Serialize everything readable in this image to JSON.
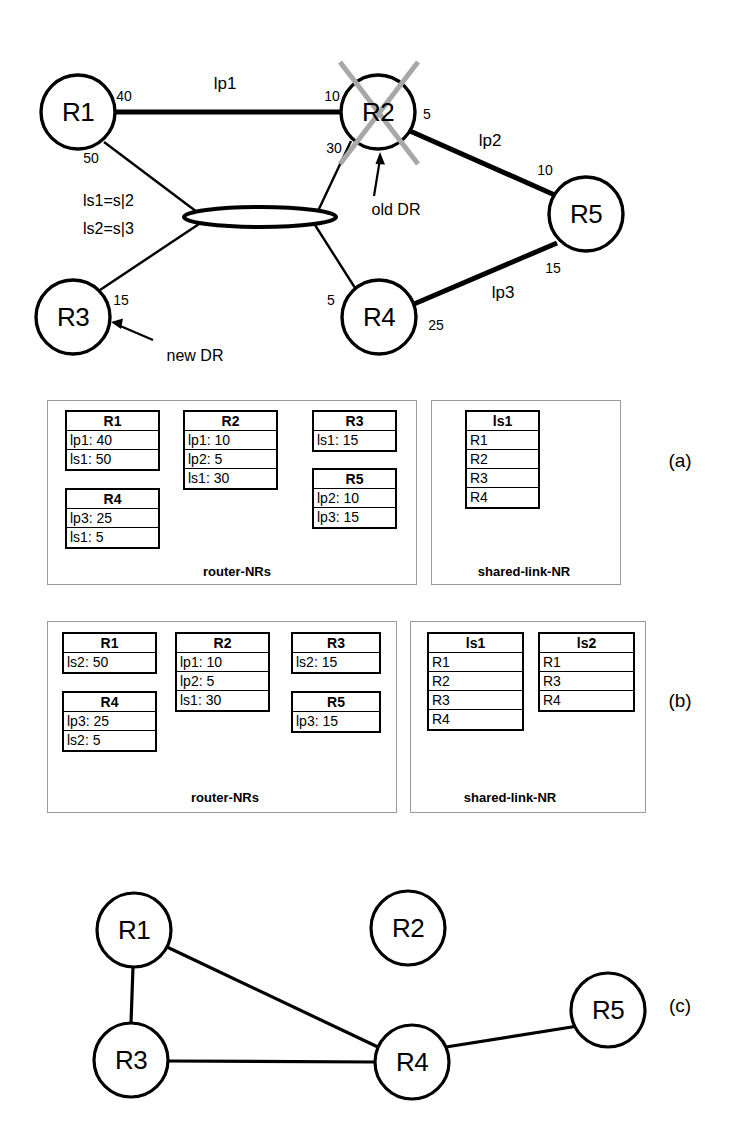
{
  "figure": {
    "panel_letters": [
      "(a)",
      "(b)",
      "(c)"
    ]
  },
  "topology": {
    "caption_old_dr": "old DR",
    "caption_new_dr": "new DR",
    "shared_link_eq1": "ls1=s|2",
    "shared_link_eq2": "ls2=s|3",
    "failed_router": "R2",
    "nodes": [
      {
        "id": "R1",
        "label": "R1",
        "cx": 78,
        "cy": 112
      },
      {
        "id": "R2",
        "label": "R2",
        "cx": 378,
        "cy": 112
      },
      {
        "id": "R3",
        "label": "R3",
        "cx": 73,
        "cy": 317
      },
      {
        "id": "R4",
        "label": "R4",
        "cx": 379,
        "cy": 317
      },
      {
        "id": "R5",
        "label": "R5",
        "cx": 586,
        "cy": 214
      }
    ],
    "shared_link": {
      "cx": 260,
      "cy": 217,
      "rx": 76,
      "ry": 10
    },
    "links": [
      {
        "name": "lp1",
        "from": "R1",
        "to": "R2",
        "w_from": "40",
        "w_to": "10"
      },
      {
        "name": "lp2",
        "from": "R2",
        "to": "R5",
        "w_from": "5",
        "w_to": "10"
      },
      {
        "name": "lp3",
        "from": "R4",
        "to": "R5",
        "w_from": "25",
        "w_to": "15"
      },
      {
        "name": "",
        "from": "R1",
        "to": "shared",
        "w_from": "50",
        "w_to": ""
      },
      {
        "name": "",
        "from": "R2",
        "to": "shared",
        "w_from": "30",
        "w_to": ""
      },
      {
        "name": "",
        "from": "R3",
        "to": "shared",
        "w_from": "15",
        "w_to": ""
      },
      {
        "name": "",
        "from": "R4",
        "to": "shared",
        "w_from": "5",
        "w_to": ""
      }
    ],
    "weight_labels": [
      {
        "text": "40",
        "x": 124,
        "y": 96
      },
      {
        "text": "10",
        "x": 332,
        "y": 96
      },
      {
        "text": "5",
        "x": 427,
        "y": 114
      },
      {
        "text": "50",
        "x": 91,
        "y": 158
      },
      {
        "text": "30",
        "x": 334,
        "y": 148
      },
      {
        "text": "10",
        "x": 545,
        "y": 170
      },
      {
        "text": "15",
        "x": 553,
        "y": 268
      },
      {
        "text": "15",
        "x": 121,
        "y": 300
      },
      {
        "text": "5",
        "x": 331,
        "y": 300
      },
      {
        "text": "25",
        "x": 436,
        "y": 325
      }
    ],
    "link_name_labels": [
      {
        "text": "lp1",
        "x": 225,
        "y": 83
      },
      {
        "text": "lp2",
        "x": 490,
        "y": 140
      },
      {
        "text": "lp3",
        "x": 503,
        "y": 292
      }
    ]
  },
  "panel_a": {
    "letter": "(a)",
    "router_caption": "router-NRs",
    "shared_caption": "shared-link-NR",
    "router_nrs": [
      {
        "header": "R1",
        "rows": [
          "lp1: 40",
          "ls1: 50"
        ]
      },
      {
        "header": "R2",
        "rows": [
          "lp1: 10",
          "lp2: 5",
          "ls1: 30"
        ]
      },
      {
        "header": "R3",
        "rows": [
          "ls1: 15"
        ]
      },
      {
        "header": "R4",
        "rows": [
          "lp3: 25",
          "ls1: 5"
        ]
      },
      {
        "header": "R5",
        "rows": [
          "lp2: 10",
          "lp3: 15"
        ]
      }
    ],
    "shared_link_nrs": [
      {
        "header": "ls1",
        "rows": [
          "R1",
          "R2",
          "R3",
          "R4"
        ]
      }
    ]
  },
  "panel_b": {
    "letter": "(b)",
    "router_caption": "router-NRs",
    "shared_caption": "shared-link-NR",
    "router_nrs": [
      {
        "header": "R1",
        "rows": [
          "ls2: 50"
        ]
      },
      {
        "header": "R2",
        "rows": [
          "lp1: 10",
          "lp2: 5",
          "ls1: 30"
        ]
      },
      {
        "header": "R3",
        "rows": [
          "ls2: 15"
        ]
      },
      {
        "header": "R4",
        "rows": [
          "lp3: 25",
          "ls2: 5"
        ]
      },
      {
        "header": "R5",
        "rows": [
          "lp3: 15"
        ]
      }
    ],
    "shared_link_nrs": [
      {
        "header": "ls1",
        "rows": [
          "R1",
          "R2",
          "R3",
          "R4"
        ]
      },
      {
        "header": "ls2",
        "rows": [
          "R1",
          "R3",
          "R4"
        ]
      }
    ]
  },
  "panel_c": {
    "letter": "(c)",
    "nodes": [
      {
        "id": "R1",
        "label": "R1",
        "cx": 134,
        "cy": 930
      },
      {
        "id": "R2",
        "label": "R2",
        "cx": 408,
        "cy": 928
      },
      {
        "id": "R3",
        "label": "R3",
        "cx": 131,
        "cy": 1060
      },
      {
        "id": "R4",
        "label": "R4",
        "cx": 412,
        "cy": 1062
      },
      {
        "id": "R5",
        "label": "R5",
        "cx": 608,
        "cy": 1010
      }
    ],
    "edges": [
      {
        "from": "R1",
        "to": "R3"
      },
      {
        "from": "R1",
        "to": "R4"
      },
      {
        "from": "R3",
        "to": "R4"
      },
      {
        "from": "R4",
        "to": "R5"
      }
    ],
    "isolated": [
      "R2"
    ]
  },
  "colors": {
    "ink": "#000000",
    "cross_out": "#a8a8a8",
    "panel_border": "#9a9a9a",
    "background": "#ffffff"
  }
}
